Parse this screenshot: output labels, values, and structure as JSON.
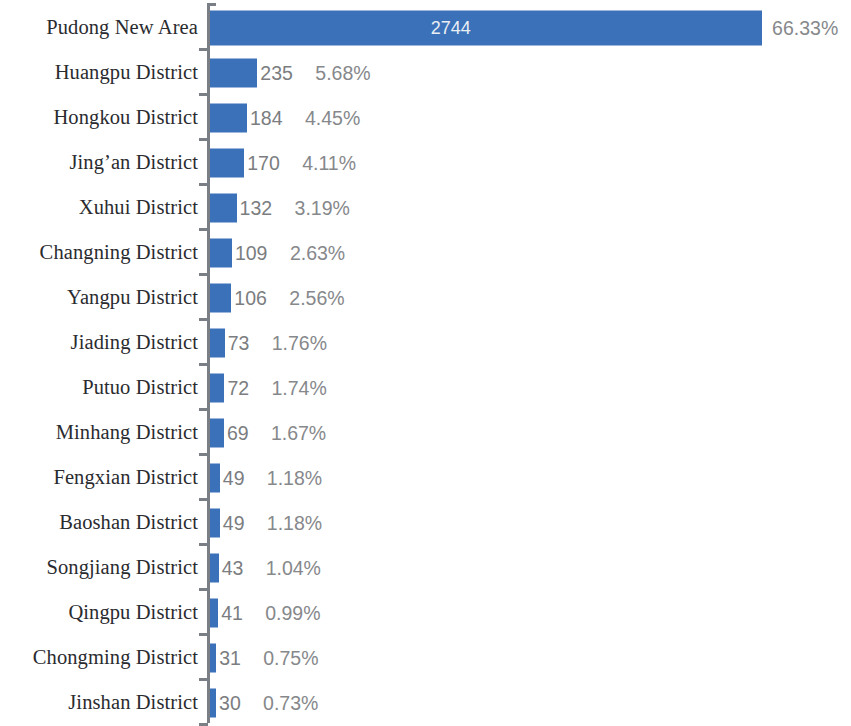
{
  "chart_data": {
    "type": "bar",
    "orientation": "horizontal",
    "title": "",
    "subtitle": "",
    "xlabel": "",
    "ylabel": "",
    "grid": false,
    "legend": null,
    "xlim": [
      0,
      2744
    ],
    "bar_color": "#3a71b8",
    "value_label_color": "#7b7d80",
    "inside_label_color": "#e9eef5",
    "categories": [
      "Pudong New Area",
      "Huangpu District",
      "Hongkou District",
      "Jing’an District",
      "Xuhui District",
      "Changning District",
      "Yangpu District",
      "Jiading District",
      "Putuo District",
      "Minhang District",
      "Fengxian District",
      "Baoshan District",
      "Songjiang District",
      "Qingpu District",
      "Chongming District",
      "Jinshan District"
    ],
    "values": [
      2744,
      235,
      184,
      170,
      132,
      109,
      106,
      73,
      72,
      69,
      49,
      49,
      43,
      41,
      31,
      30
    ],
    "percent_labels": [
      "66.33%",
      "5.68%",
      "4.45%",
      "4.11%",
      "3.19%",
      "2.63%",
      "2.56%",
      "1.76%",
      "1.74%",
      "1.67%",
      "1.18%",
      "1.18%",
      "1.04%",
      "0.99%",
      "0.75%",
      "0.73%"
    ],
    "value_labels": [
      "2744",
      "235",
      "184",
      "170",
      "132",
      "109",
      "106",
      "73",
      "72",
      "69",
      "49",
      "49",
      "43",
      "41",
      "31",
      "30"
    ]
  },
  "rows": [
    {
      "category": "Pudong New Area",
      "value": "2744",
      "percent": "66.33%"
    },
    {
      "category": "Huangpu District",
      "value": "235",
      "percent": "5.68%"
    },
    {
      "category": "Hongkou District",
      "value": "184",
      "percent": "4.45%"
    },
    {
      "category": "Jing’an District",
      "value": "170",
      "percent": "4.11%"
    },
    {
      "category": "Xuhui District",
      "value": "132",
      "percent": "3.19%"
    },
    {
      "category": "Changning District",
      "value": "109",
      "percent": "2.63%"
    },
    {
      "category": "Yangpu District",
      "value": "106",
      "percent": "2.56%"
    },
    {
      "category": "Jiading District",
      "value": "73",
      "percent": "1.76%"
    },
    {
      "category": "Putuo District",
      "value": "72",
      "percent": "1.74%"
    },
    {
      "category": "Minhang District",
      "value": "69",
      "percent": "1.67%"
    },
    {
      "category": "Fengxian District",
      "value": "49",
      "percent": "1.18%"
    },
    {
      "category": "Baoshan District",
      "value": "49",
      "percent": "1.18%"
    },
    {
      "category": "Songjiang District",
      "value": "43",
      "percent": "1.04%"
    },
    {
      "category": "Qingpu District",
      "value": "41",
      "percent": "0.99%"
    },
    {
      "category": "Chongming District",
      "value": "31",
      "percent": "0.75%"
    },
    {
      "category": "Jinshan District",
      "value": "30",
      "percent": "0.73%"
    }
  ]
}
